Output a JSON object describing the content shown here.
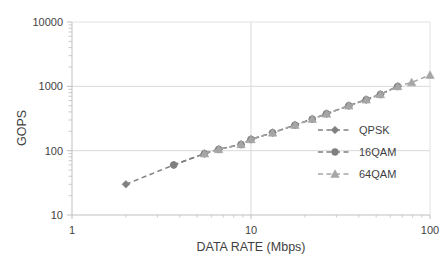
{
  "chart_data": {
    "type": "line",
    "title": "",
    "xlabel": "DATA RATE (Mbps)",
    "ylabel": "GOPS",
    "xscale": "log",
    "yscale": "log",
    "xlim": [
      1,
      100
    ],
    "ylim": [
      10,
      10000
    ],
    "xticks": [
      "1",
      "10",
      "100"
    ],
    "xtick_values": [
      1,
      10,
      100
    ],
    "yticks": [
      "10",
      "100",
      "1000",
      "10000"
    ],
    "ytick_values": [
      10,
      100,
      1000,
      10000
    ],
    "grid": true,
    "grid_color": "#d9d9d9",
    "minor_ticks": true,
    "legend_position": "right-inside",
    "series": [
      {
        "name": "QPSK",
        "marker": "diamond",
        "color": "#808080",
        "linestyle": "dashed",
        "x": [
          2,
          3.7,
          5.5,
          6.6,
          8.8,
          10,
          13.2,
          17.6,
          22,
          26.4,
          35.2,
          44,
          52.8,
          66
        ],
        "y": [
          30,
          60,
          90,
          105,
          125,
          150,
          190,
          250,
          310,
          375,
          500,
          620,
          750,
          1000
        ]
      },
      {
        "name": "16QAM",
        "marker": "circle",
        "color": "#7f7f7f",
        "linestyle": "dashed",
        "x": [
          3.7,
          5.5,
          6.6,
          8.8,
          10,
          13.2,
          17.6,
          22,
          26.4,
          35.2,
          44,
          52.8,
          66
        ],
        "y": [
          60,
          90,
          105,
          125,
          150,
          190,
          250,
          310,
          375,
          500,
          620,
          750,
          1000
        ]
      },
      {
        "name": "64QAM",
        "marker": "triangle",
        "color": "#a6a6a6",
        "linestyle": "dashed",
        "x": [
          5.5,
          6.6,
          8.8,
          10,
          13.2,
          17.6,
          22,
          26.4,
          35.2,
          44,
          52.8,
          66,
          79,
          100
        ],
        "y": [
          90,
          105,
          125,
          150,
          190,
          250,
          310,
          375,
          500,
          620,
          750,
          1000,
          1150,
          1500
        ]
      }
    ]
  },
  "axes": {
    "x_title": "DATA RATE (Mbps)",
    "y_title": "GOPS",
    "x_tick_labels": [
      "1",
      "10",
      "100"
    ],
    "y_tick_labels": [
      "10000",
      "1000",
      "100",
      "10"
    ]
  },
  "legend": {
    "items": [
      {
        "label": "QPSK",
        "marker": "diamond-marker",
        "color": "#808080"
      },
      {
        "label": "16QAM",
        "marker": "circle-marker",
        "color": "#7f7f7f"
      },
      {
        "label": "64QAM",
        "marker": "triangle-marker",
        "color": "#a6a6a6"
      }
    ]
  },
  "colors": {
    "background": "#ffffff",
    "grid": "#d9d9d9",
    "axis": "#bfbfbf",
    "text": "#3f3f3f",
    "qpsk": "#808080",
    "qam16": "#7f7f7f",
    "qam64": "#a6a6a6"
  }
}
